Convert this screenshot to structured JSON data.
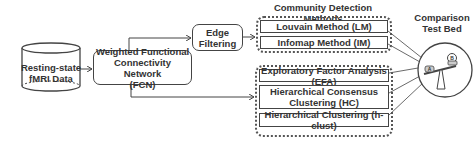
{
  "nodes": {
    "data_source": {
      "line1": "Resting-state",
      "line2": "fMRI Data"
    },
    "fcn": {
      "line1": "Weighted Functional",
      "line2": "Connectivity Network",
      "line3": "(FCN)"
    },
    "edge_filtering": {
      "line1": "Edge",
      "line2": "Filtering"
    }
  },
  "community_detection": {
    "title": "Community Detection Methods",
    "methods": [
      {
        "label": "Louvain Method (LM)"
      },
      {
        "label": "Infomap Method (IM)"
      }
    ]
  },
  "other_methods": {
    "methods": [
      {
        "label": "Exploratory Factor Analysis (EFA)"
      },
      {
        "line1": "Hierarchical Consensus",
        "line2": "Clustering (HC)"
      },
      {
        "label": "Hierarchical Clustering (h-clust)"
      }
    ]
  },
  "comparison": {
    "title_line1": "Comparison",
    "title_line2": "Test Bed",
    "pan_a": "A",
    "pan_b": "B"
  },
  "colors": {
    "stroke": "#444444",
    "text": "#333333",
    "background": "#ffffff"
  }
}
